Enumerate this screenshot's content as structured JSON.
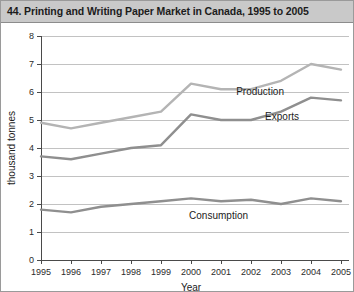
{
  "figure": {
    "title": "44. Printing and Writing Paper Market in Canada, 1995 to 2005",
    "background_color": "#ffffff",
    "title_bar_color": "#c9c9c9",
    "border_color": "#9a9a9a"
  },
  "chart_data": {
    "type": "line",
    "title": "44. Printing and Writing Paper Market in Canada, 1995 to 2005",
    "xlabel": "Year",
    "ylabel": "thousand tonnes",
    "x": [
      1995,
      1996,
      1997,
      1998,
      1999,
      2000,
      2001,
      2002,
      2003,
      2004,
      2005
    ],
    "xticklabels": [
      "1995",
      "1996",
      "1997",
      "1998",
      "1999",
      "2000",
      "2001",
      "2002",
      "2003",
      "2004",
      "2005"
    ],
    "yticklabels": [
      "0",
      "1",
      "2",
      "3",
      "4",
      "5",
      "6",
      "7",
      "8"
    ],
    "ylim": [
      0,
      8
    ],
    "ytick_step": 1,
    "grid": "horizontal",
    "legend_position": "inline-right",
    "series": [
      {
        "name": "Production",
        "color": "#b4b4b4",
        "values": [
          4.9,
          4.7,
          4.9,
          5.1,
          5.3,
          6.3,
          6.1,
          6.1,
          6.4,
          7.0,
          6.8
        ],
        "label_x": 2003.1,
        "label_y": 5.9
      },
      {
        "name": "Exports",
        "color": "#8f8f8f",
        "values": [
          3.7,
          3.6,
          3.8,
          4.0,
          4.1,
          5.2,
          5.0,
          5.0,
          5.3,
          5.8,
          5.7
        ],
        "label_x": 2003.6,
        "label_y": 5.0
      },
      {
        "name": "Consumption",
        "color": "#8f8f8f",
        "values": [
          1.8,
          1.7,
          1.9,
          2.0,
          2.1,
          2.2,
          2.1,
          2.15,
          2.0,
          2.2,
          2.1
        ],
        "label_x": 2001.9,
        "label_y": 1.45
      }
    ]
  }
}
